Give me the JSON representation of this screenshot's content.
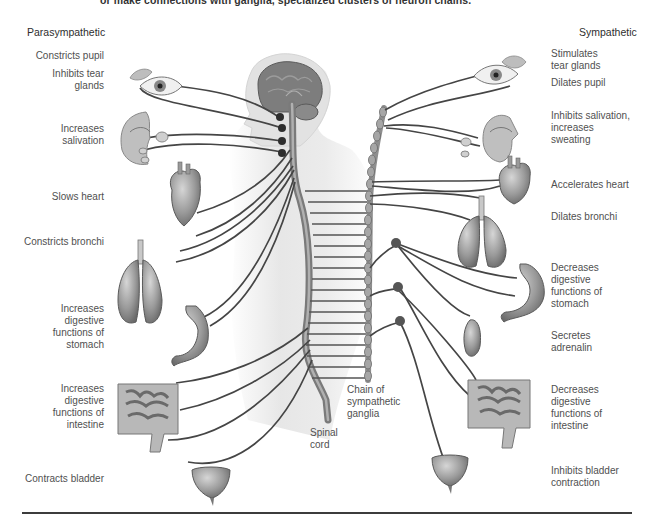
{
  "caption_top": "or make connections with ganglia, specialized clusters of neuron chains.",
  "headings": {
    "left": "Parasympathetic",
    "right": "Sympathetic"
  },
  "parasympathetic_effects": [
    {
      "label": "Constricts pupil",
      "organ": "eye"
    },
    {
      "label": "Inhibits tear glands",
      "organ": "tear-gland"
    },
    {
      "label": "Increases salivation",
      "organ": "salivary-glands"
    },
    {
      "label": "Slows heart",
      "organ": "heart"
    },
    {
      "label": "Constricts bronchi",
      "organ": "lungs"
    },
    {
      "label": "Increases digestive functions of stomach",
      "organ": "stomach"
    },
    {
      "label": "Increases digestive functions of intestine",
      "organ": "intestine"
    },
    {
      "label": "Contracts bladder",
      "organ": "bladder"
    }
  ],
  "sympathetic_effects": [
    {
      "label": "Stimulates tear glands",
      "organ": "tear-gland"
    },
    {
      "label": "Dilates pupil",
      "organ": "eye"
    },
    {
      "label": "Inhibits salivation, increases sweating",
      "organ": "salivary-glands"
    },
    {
      "label": "Accelerates heart",
      "organ": "heart"
    },
    {
      "label": "Dilates bronchi",
      "organ": "lungs"
    },
    {
      "label": "Decreases digestive functions of stomach",
      "organ": "stomach"
    },
    {
      "label": "Secretes adrenalin",
      "organ": "adrenal-gland"
    },
    {
      "label": "Decreases digestive functions of intestine",
      "organ": "intestine"
    },
    {
      "label": "Inhibits bladder contraction",
      "organ": "bladder"
    }
  ],
  "center_labels": {
    "chain": "Chain of sympathetic ganglia",
    "spinal_cord": "Spinal cord"
  },
  "lines_left": {
    "l0": "Constricts pupil",
    "l1a": "Inhibits tear",
    "l1b": "glands",
    "l2a": "Increases",
    "l2b": "salivation",
    "l3": "Slows heart",
    "l4": "Constricts bronchi",
    "l5a": "Increases",
    "l5b": "digestive",
    "l5c": "functions of",
    "l5d": "stomach",
    "l6a": "Increases",
    "l6b": "digestive",
    "l6c": "functions of",
    "l6d": "intestine",
    "l7": "Contracts bladder"
  },
  "lines_right": {
    "r0a": "Stimulates",
    "r0b": "tear glands",
    "r1": "Dilates pupil",
    "r2a": "Inhibits salivation,",
    "r2b": "increases",
    "r2c": "sweating",
    "r3": "Accelerates heart",
    "r4": "Dilates bronchi",
    "r5a": "Decreases",
    "r5b": "digestive",
    "r5c": "functions of",
    "r5d": "stomach",
    "r6a": "Secretes",
    "r6b": "adrenalin",
    "r7a": "Decreases",
    "r7b": "digestive",
    "r7c": "functions of",
    "r7d": "intestine",
    "r8a": "Inhibits bladder",
    "r8b": "contraction"
  },
  "center_lines": {
    "c0": "Chain of",
    "c1": "sympathetic",
    "c2": "ganglia",
    "s0": "Spinal",
    "s1": "cord"
  },
  "colors": {
    "nerve": "#4a4a4a",
    "organ_fill": "#9a9a9a",
    "body_silhouette": "#e6e6e6",
    "spinal_cord": "#8c8c8c",
    "brain": "#7a7a7a",
    "ganglion_node": "#3a3a3a",
    "text": "#505050"
  }
}
